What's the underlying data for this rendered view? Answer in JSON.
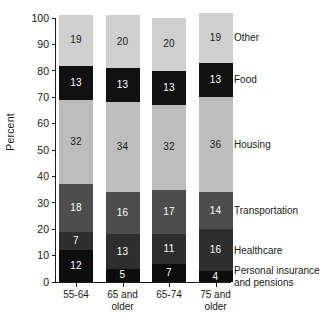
{
  "chart_data": {
    "type": "bar",
    "stacked": true,
    "title": "",
    "subtitle": "",
    "xlabel": "",
    "ylabel": "Percent",
    "ylim": [
      0,
      100
    ],
    "yticks": [
      0,
      10,
      20,
      30,
      40,
      50,
      60,
      70,
      80,
      90,
      100
    ],
    "grid": false,
    "legend_position": "right",
    "categories": [
      "55-64",
      "65 and older",
      "65-74",
      "75 and older"
    ],
    "category_lines": [
      [
        "55-64"
      ],
      [
        "65 and",
        "older"
      ],
      [
        "65-74"
      ],
      [
        "75 and",
        "older"
      ]
    ],
    "series": [
      {
        "name": "Personal insurance and pensions",
        "values": [
          12,
          5,
          7,
          4
        ],
        "color": "#0d0d0d",
        "label_color": "#ffffff"
      },
      {
        "name": "Healthcare",
        "values": [
          7,
          13,
          11,
          16
        ],
        "color": "#2e2e2e",
        "label_color": "#ffffff"
      },
      {
        "name": "Transportation",
        "values": [
          18,
          16,
          17,
          14
        ],
        "color": "#4d4d4d",
        "label_color": "#ffffff"
      },
      {
        "name": "Housing",
        "values": [
          32,
          34,
          32,
          36
        ],
        "color": "#bdbdbd",
        "label_color": "#1a1a1a"
      },
      {
        "name": "Food",
        "values": [
          13,
          13,
          13,
          13
        ],
        "color": "#111111",
        "label_color": "#ffffff"
      },
      {
        "name": "Other",
        "values": [
          19,
          20,
          20,
          19
        ],
        "color": "#cfcfcf",
        "label_color": "#1a1a1a"
      }
    ],
    "legend_entries": [
      {
        "label": "Other",
        "lines": [
          "Other"
        ]
      },
      {
        "label": "Food",
        "lines": [
          "Food"
        ]
      },
      {
        "label": "Housing",
        "lines": [
          "Housing"
        ]
      },
      {
        "label": "Transportation",
        "lines": [
          "Transportation"
        ]
      },
      {
        "label": "Healthcare",
        "lines": [
          "Healthcare"
        ]
      },
      {
        "label": "Personal insurance and pensions",
        "lines": [
          "Personal insurance",
          "and pensions"
        ]
      }
    ]
  }
}
